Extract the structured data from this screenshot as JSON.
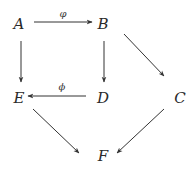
{
  "diagram": {
    "type": "commutative-diagram",
    "nodes": [
      {
        "id": "A",
        "label": "A",
        "x": 19,
        "y": 24
      },
      {
        "id": "B",
        "label": "B",
        "x": 103,
        "y": 24
      },
      {
        "id": "C",
        "label": "C",
        "x": 180,
        "y": 98
      },
      {
        "id": "D",
        "label": "D",
        "x": 103,
        "y": 98
      },
      {
        "id": "E",
        "label": "E",
        "x": 19,
        "y": 98
      },
      {
        "id": "F",
        "label": "F",
        "x": 103,
        "y": 156
      }
    ],
    "edges": [
      {
        "from": "A",
        "to": "B",
        "label": "φ"
      },
      {
        "from": "A",
        "to": "E",
        "label": ""
      },
      {
        "from": "B",
        "to": "D",
        "label": ""
      },
      {
        "from": "B",
        "to": "C",
        "label": ""
      },
      {
        "from": "D",
        "to": "E",
        "label": "ϕ"
      },
      {
        "from": "E",
        "to": "F",
        "label": ""
      },
      {
        "from": "C",
        "to": "F",
        "label": ""
      }
    ],
    "colors": {
      "stroke": "#333333",
      "text": "#2a2a2a"
    }
  }
}
